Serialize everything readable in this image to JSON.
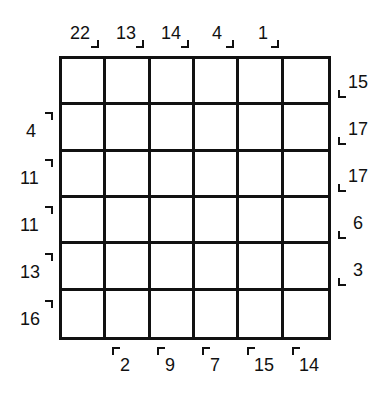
{
  "puzzle": {
    "rows": 6,
    "cols": 6,
    "top_clues": [
      "22",
      "13",
      "14",
      "4",
      "1"
    ],
    "left_clues": [
      "4",
      "11",
      "11",
      "13",
      "16"
    ],
    "right_clues": [
      "15",
      "17",
      "17",
      "6",
      "3"
    ],
    "bottom_clues": [
      "2",
      "9",
      "7",
      "15",
      "14"
    ]
  }
}
